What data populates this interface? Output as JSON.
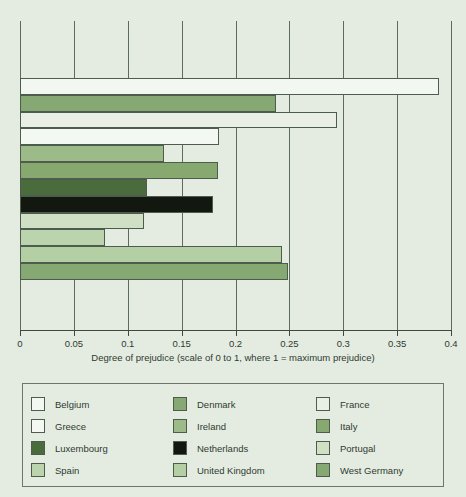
{
  "chart_data": {
    "type": "bar",
    "orientation": "horizontal",
    "title": "",
    "xlabel": "Degree of prejudice (scale of 0 to 1, where 1 = maximum prejudice)",
    "ylabel": "",
    "xlim": [
      0,
      0.4
    ],
    "xticks": [
      "0",
      "0.05",
      "0.1",
      "0.15",
      "0.2",
      "0.25",
      "0.3",
      "0.35",
      "0.4"
    ],
    "xtick_values": [
      0,
      0.05,
      0.1,
      0.15,
      0.2,
      0.25,
      0.3,
      0.35,
      0.4
    ],
    "grid": true,
    "grid_axis": "x",
    "legend_position": "bottom",
    "legend_columns": 3,
    "categories": [
      "Belgium",
      "Denmark",
      "France",
      "Greece",
      "Ireland",
      "Italy",
      "Luxembourg",
      "Netherlands",
      "Portugal",
      "Spain",
      "United Kingdom",
      "West Germany"
    ],
    "values": [
      0.389,
      0.238,
      0.294,
      0.185,
      0.134,
      0.184,
      0.118,
      0.179,
      0.115,
      0.079,
      0.243,
      0.249
    ],
    "bar_colors": [
      "#f3f7f1",
      "#86a873",
      "#eaefe6",
      "#f4f8f2",
      "#9cbb88",
      "#87a96f",
      "#4a6b3c",
      "#12170f",
      "#cfe0c4",
      "#bcd4ae",
      "#b4cfa4",
      "#86a873"
    ],
    "bar_edge_color": "#4e5c4e",
    "background_color": "#e4ece2",
    "axis_color": "#3d4a3d",
    "text_color": "#2f3a2f"
  },
  "legend": {
    "order": [
      "Belgium",
      "Denmark",
      "France",
      "Greece",
      "Ireland",
      "Italy",
      "Luxembourg",
      "Netherlands",
      "Portugal",
      "Spain",
      "United Kingdom",
      "West Germany"
    ],
    "swatch_colors": {
      "Belgium": "#f3f7f1",
      "Denmark": "#86a873",
      "France": "#eaefe6",
      "Greece": "#f4f8f2",
      "Ireland": "#9cbb88",
      "Italy": "#87a96f",
      "Luxembourg": "#4a6b3c",
      "Netherlands": "#12170f",
      "Portugal": "#cfe0c4",
      "Spain": "#bcd4ae",
      "United Kingdom": "#b4cfa4",
      "West Germany": "#86a873"
    }
  }
}
